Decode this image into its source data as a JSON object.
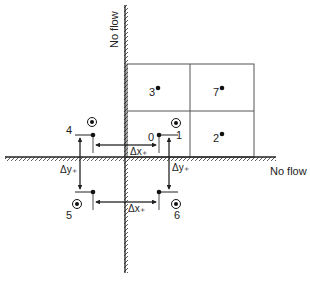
{
  "diagram": {
    "wall_labels": {
      "vertical": "No flow",
      "horizontal": "No flow"
    },
    "cell_points": [
      {
        "label": "0",
        "kind": "real-node"
      },
      {
        "label": "3",
        "kind": "real-node"
      },
      {
        "label": "7",
        "kind": "real-node"
      },
      {
        "label": "2",
        "kind": "real-node"
      }
    ],
    "image_points": [
      {
        "label": "1",
        "kind": "image-node"
      },
      {
        "label": "4",
        "kind": "image-node"
      },
      {
        "label": "5",
        "kind": "image-node"
      },
      {
        "label": "6",
        "kind": "image-node"
      }
    ],
    "dimension_labels": {
      "dx_top": "Δx₊",
      "dx_bottom": "Δx₊",
      "dy_left": "Δy₊",
      "dy_right": "Δy₊"
    },
    "colors": {
      "line": "#333333",
      "grid": "#555555",
      "text": "#222222"
    }
  }
}
